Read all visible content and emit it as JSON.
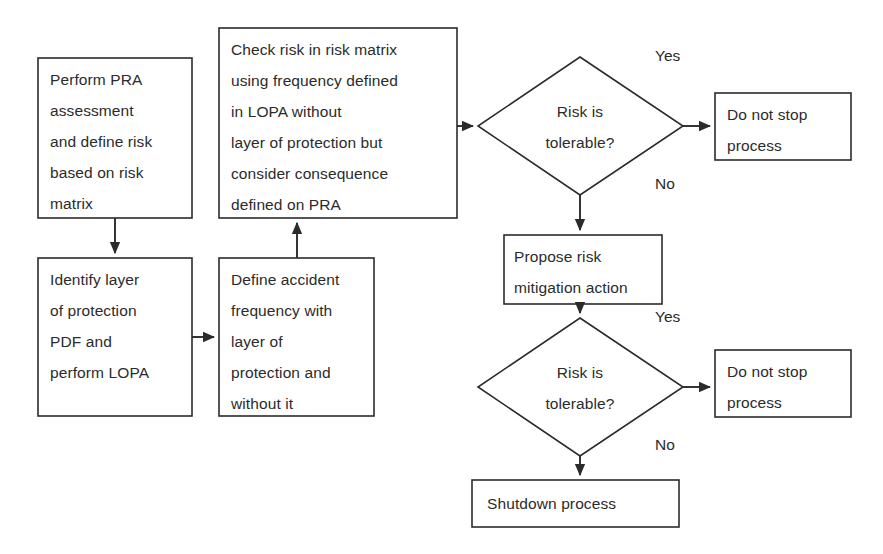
{
  "diagram": {
    "background_color": "#ffffff",
    "line_color": "#2b2b2b",
    "text_color": "#2b2b2b"
  },
  "nodes": {
    "perform_pra": {
      "shape": "process",
      "text": "Perform PRA\nassessment\nand define risk\nbased on risk\nmatrix"
    },
    "identify_layer": {
      "shape": "process",
      "text": "Identify layer\nof protection\nPDF and\nperform LOPA"
    },
    "define_accident": {
      "shape": "process",
      "text": "Define accident\nfrequency with\nlayer of\nprotection and\nwithout it"
    },
    "check_risk": {
      "shape": "process",
      "text": "Check risk in risk matrix\nusing frequency defined\nin LOPA  without\nlayer of protection but\nconsider consequence\ndefined on PRA"
    },
    "decision_one": {
      "shape": "decision",
      "text": "Risk is\ntolerable?"
    },
    "do_not_stop_one": {
      "shape": "process",
      "text": "Do not stop\nprocess"
    },
    "propose_mitigation": {
      "shape": "process",
      "text": "Propose risk\nmitigation action"
    },
    "decision_two": {
      "shape": "decision",
      "text": "Risk is\ntolerable?"
    },
    "do_not_stop_two": {
      "shape": "process",
      "text": "Do not stop\nprocess"
    },
    "shutdown": {
      "shape": "process",
      "text": "Shutdown process"
    }
  },
  "edge_labels": {
    "yes_one": "Yes",
    "no_one": "No",
    "yes_two": "Yes",
    "no_two": "No"
  }
}
